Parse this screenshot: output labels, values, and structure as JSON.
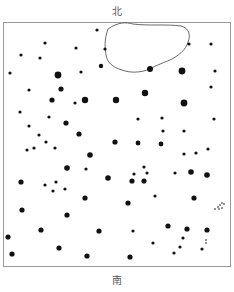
{
  "labels": {
    "north": "北",
    "south": "南"
  },
  "colors": {
    "dot": "#111111",
    "outline": "#444444",
    "border": "#9a9a9a"
  },
  "pond": {
    "path": "M108,29 C118,22 126,22 133,24 C148,26 168,24 181,26 C189,28 191,35 188,42 C186,50 178,56 170,60 C160,64 155,66 150,69 C140,73 130,73 122,70 C112,67 107,62 106,55 C105,48 104,40 108,29 Z"
  },
  "dots": [
    {
      "x": 97,
      "y": 30,
      "r": 1.6
    },
    {
      "x": 45,
      "y": 43,
      "r": 1.6
    },
    {
      "x": 76,
      "y": 48,
      "r": 1.6
    },
    {
      "x": 105,
      "y": 49,
      "r": 1.6
    },
    {
      "x": 189,
      "y": 44,
      "r": 1.6
    },
    {
      "x": 211,
      "y": 44,
      "r": 1.6
    },
    {
      "x": 21,
      "y": 55,
      "r": 1.6
    },
    {
      "x": 40,
      "y": 58,
      "r": 1.6
    },
    {
      "x": 101,
      "y": 66,
      "r": 2.2
    },
    {
      "x": 150,
      "y": 69,
      "r": 3
    },
    {
      "x": 182,
      "y": 71,
      "r": 3.4
    },
    {
      "x": 10,
      "y": 73,
      "r": 1.6
    },
    {
      "x": 58,
      "y": 75,
      "r": 3.4
    },
    {
      "x": 81,
      "y": 72,
      "r": 1.6
    },
    {
      "x": 215,
      "y": 71,
      "r": 1.6
    },
    {
      "x": 211,
      "y": 87,
      "r": 1.6
    },
    {
      "x": 29,
      "y": 90,
      "r": 1.6
    },
    {
      "x": 61,
      "y": 89,
      "r": 2.6
    },
    {
      "x": 145,
      "y": 93,
      "r": 3.2
    },
    {
      "x": 52,
      "y": 100,
      "r": 2.6
    },
    {
      "x": 75,
      "y": 103,
      "r": 1.6
    },
    {
      "x": 85,
      "y": 100,
      "r": 3.2
    },
    {
      "x": 116,
      "y": 100,
      "r": 3.2
    },
    {
      "x": 184,
      "y": 103,
      "r": 3.4
    },
    {
      "x": 20,
      "y": 112,
      "r": 1.6
    },
    {
      "x": 49,
      "y": 117,
      "r": 1.6
    },
    {
      "x": 66,
      "y": 123,
      "r": 2.6
    },
    {
      "x": 29,
      "y": 126,
      "r": 1.6
    },
    {
      "x": 138,
      "y": 119,
      "r": 1.6
    },
    {
      "x": 162,
      "y": 118,
      "r": 1.6
    },
    {
      "x": 214,
      "y": 119,
      "r": 1.6
    },
    {
      "x": 39,
      "y": 135,
      "r": 1.6
    },
    {
      "x": 79,
      "y": 134,
      "r": 2.6
    },
    {
      "x": 46,
      "y": 142,
      "r": 1.6
    },
    {
      "x": 163,
      "y": 131,
      "r": 1.6
    },
    {
      "x": 184,
      "y": 131,
      "r": 1.6
    },
    {
      "x": 27,
      "y": 150,
      "r": 1.6
    },
    {
      "x": 34,
      "y": 148,
      "r": 1.6
    },
    {
      "x": 55,
      "y": 148,
      "r": 1.6
    },
    {
      "x": 115,
      "y": 142,
      "r": 2.6
    },
    {
      "x": 138,
      "y": 143,
      "r": 2.4
    },
    {
      "x": 161,
      "y": 144,
      "r": 2.4
    },
    {
      "x": 90,
      "y": 155,
      "r": 2.8
    },
    {
      "x": 184,
      "y": 154,
      "r": 1.6
    },
    {
      "x": 196,
      "y": 153,
      "r": 1.6
    },
    {
      "x": 208,
      "y": 149,
      "r": 1.6
    },
    {
      "x": 67,
      "y": 168,
      "r": 2.8
    },
    {
      "x": 86,
      "y": 169,
      "r": 1.6
    },
    {
      "x": 108,
      "y": 178,
      "r": 2.8
    },
    {
      "x": 134,
      "y": 174,
      "r": 1.6
    },
    {
      "x": 144,
      "y": 167,
      "r": 1.6
    },
    {
      "x": 147,
      "y": 173,
      "r": 1.6
    },
    {
      "x": 175,
      "y": 173,
      "r": 1.6
    },
    {
      "x": 191,
      "y": 172,
      "r": 2.8
    },
    {
      "x": 207,
      "y": 175,
      "r": 2.8
    },
    {
      "x": 21,
      "y": 182,
      "r": 2.6
    },
    {
      "x": 45,
      "y": 185,
      "r": 1.6
    },
    {
      "x": 56,
      "y": 182,
      "r": 1.6
    },
    {
      "x": 53,
      "y": 191,
      "r": 1.6
    },
    {
      "x": 65,
      "y": 189,
      "r": 1.6
    },
    {
      "x": 132,
      "y": 181,
      "r": 2.6
    },
    {
      "x": 144,
      "y": 181,
      "r": 2.6
    },
    {
      "x": 155,
      "y": 196,
      "r": 1.6
    },
    {
      "x": 85,
      "y": 198,
      "r": 2.6
    },
    {
      "x": 194,
      "y": 198,
      "r": 2.6
    },
    {
      "x": 22,
      "y": 210,
      "r": 2.6
    },
    {
      "x": 128,
      "y": 203,
      "r": 2.6
    },
    {
      "x": 67,
      "y": 215,
      "r": 2.6
    },
    {
      "x": 41,
      "y": 230,
      "r": 2.6
    },
    {
      "x": 99,
      "y": 231,
      "r": 2.6
    },
    {
      "x": 133,
      "y": 231,
      "r": 1.6
    },
    {
      "x": 168,
      "y": 226,
      "r": 2.6
    },
    {
      "x": 187,
      "y": 229,
      "r": 2.6
    },
    {
      "x": 207,
      "y": 230,
      "r": 2.6
    },
    {
      "x": 8,
      "y": 237,
      "r": 2.6
    },
    {
      "x": 183,
      "y": 238,
      "r": 1.6
    },
    {
      "x": 180,
      "y": 247,
      "r": 1.6
    },
    {
      "x": 153,
      "y": 243,
      "r": 1.6
    },
    {
      "x": 59,
      "y": 248,
      "r": 2.6
    },
    {
      "x": 12,
      "y": 254,
      "r": 2.6
    },
    {
      "x": 87,
      "y": 256,
      "r": 2.6
    },
    {
      "x": 130,
      "y": 257,
      "r": 2.6
    },
    {
      "x": 174,
      "y": 253,
      "r": 1.6
    },
    {
      "x": 202,
      "y": 249,
      "r": 1.6
    },
    {
      "x": 215,
      "y": 209,
      "r": 0.8
    },
    {
      "x": 218,
      "y": 207,
      "r": 0.8
    },
    {
      "x": 220,
      "y": 205,
      "r": 0.8
    },
    {
      "x": 222,
      "y": 203,
      "r": 0.8
    },
    {
      "x": 219,
      "y": 209,
      "r": 0.8
    },
    {
      "x": 222,
      "y": 208,
      "r": 0.8
    },
    {
      "x": 224,
      "y": 204,
      "r": 0.8
    },
    {
      "x": 206,
      "y": 240,
      "r": 0.8
    },
    {
      "x": 206,
      "y": 243,
      "r": 0.8
    }
  ]
}
